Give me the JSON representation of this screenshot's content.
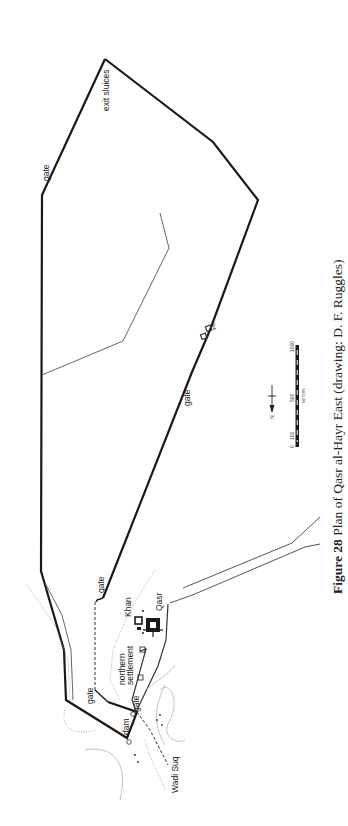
{
  "figure": {
    "caption_label": "Figure 28",
    "caption_text": " Plan of Qasr al-Hayr East (drawing: D. F. Ruggles)"
  },
  "labels": {
    "exit_sluices": "exit sluices",
    "gate_north": "gate",
    "gate_east_wall": "gate",
    "gate_small": "gate",
    "gate_inner_upper": "gate",
    "gate_inner_lower": "gate",
    "gate_dam": "gate",
    "khan": "Khan",
    "qasr": "Qasr",
    "northern_settlement_1": "northern",
    "northern_settlement_2": "settlement",
    "dam": "dam",
    "wadi_suq": "Wadi Suq"
  },
  "scale_bar": {
    "ticks": [
      "0",
      "100",
      "500",
      "1000"
    ],
    "unit": "METERS"
  },
  "north_arrow": {
    "label": "N"
  },
  "colors": {
    "wall": "#1a1a1a",
    "thin_line": "#555555",
    "contour": "#b5b5b5",
    "background": "#ffffff"
  }
}
